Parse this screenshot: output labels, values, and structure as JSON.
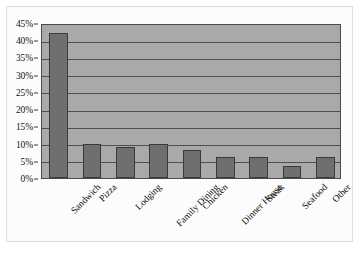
{
  "chart_data": {
    "type": "bar",
    "title": "",
    "subtitle": "",
    "xlabel": "",
    "ylabel": "",
    "categories": [
      "Sandwich",
      "Pizza",
      "Lodging",
      "Family Dining",
      "Chicken",
      "Dinner House",
      "Steak",
      "Seafood",
      "Other"
    ],
    "values": [
      42,
      10,
      9,
      10,
      8,
      6,
      6,
      3.5,
      6
    ],
    "value_labels": [
      "42%",
      "10%",
      "9%",
      "10%",
      "8%",
      "6%",
      "6%",
      "3.5%",
      "6%"
    ],
    "ylim": [
      0,
      45
    ],
    "ytick_values": [
      0,
      5,
      10,
      15,
      20,
      25,
      30,
      35,
      40,
      45
    ],
    "ytick_labels": [
      "0%",
      "5%",
      "10%",
      "15%",
      "20%",
      "25%",
      "30%",
      "35%",
      "40%",
      "45%"
    ],
    "grid": true,
    "grid_axis": "y",
    "legend": false,
    "legend_position": "none",
    "series": [
      {
        "name": "Share",
        "values": [
          42,
          10,
          9,
          10,
          8,
          6,
          6,
          3.5,
          6
        ]
      }
    ]
  },
  "style": {
    "plot_background": "#a9a9a9",
    "bar_fill": "#6f6f6f",
    "bar_border": "#3a3a3a",
    "gridline_color": "#4f4f4f",
    "axis_color": "#3a3a3a",
    "page_background": "#ffffff",
    "text_color": "#111111"
  }
}
